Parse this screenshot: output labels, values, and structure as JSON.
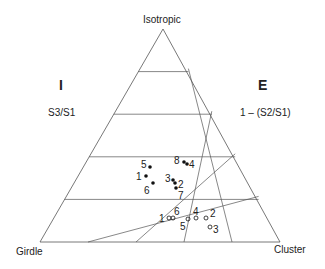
{
  "diagram": {
    "type": "ternary",
    "vertices": {
      "top": "Isotropic",
      "bottom_left": "Girdle",
      "bottom_right": "Cluster"
    },
    "left_index": {
      "symbol": "I",
      "formula": "S3/S1"
    },
    "right_index": {
      "symbol": "E",
      "formula": "1 – (S2/S1)"
    },
    "colors": {
      "line": "#555555",
      "text": "#222222",
      "point": "#111111"
    },
    "series": [
      {
        "name": "filled",
        "marker": "filled-circle",
        "points": [
          {
            "label": "5",
            "x": 150,
            "y": 167,
            "lx": 141,
            "ly": 160
          },
          {
            "label": "1",
            "x": 146,
            "y": 176,
            "lx": 136,
            "ly": 172
          },
          {
            "label": "6",
            "x": 153,
            "y": 183,
            "lx": 144,
            "ly": 186
          },
          {
            "label": "8",
            "x": 184,
            "y": 162,
            "lx": 174,
            "ly": 156
          },
          {
            "label": "4",
            "x": 187,
            "y": 164,
            "lx": 189,
            "ly": 160
          },
          {
            "label": "3",
            "x": 173,
            "y": 180,
            "lx": 165,
            "ly": 174
          },
          {
            "label": "2",
            "x": 175,
            "y": 183,
            "lx": 178,
            "ly": 180
          },
          {
            "label": "7",
            "x": 176,
            "y": 188,
            "lx": 178,
            "ly": 191
          }
        ]
      },
      {
        "name": "open",
        "marker": "open-circle",
        "points": [
          {
            "label": "1",
            "x": 169,
            "y": 218,
            "lx": 159,
            "ly": 214
          },
          {
            "label": "6",
            "x": 173,
            "y": 218,
            "lx": 174,
            "ly": 207
          },
          {
            "label": "5",
            "x": 188,
            "y": 219,
            "lx": 180,
            "ly": 222
          },
          {
            "label": "4",
            "x": 196,
            "y": 218,
            "lx": 193,
            "ly": 207
          },
          {
            "label": "2",
            "x": 206,
            "y": 218,
            "lx": 210,
            "ly": 209
          },
          {
            "label": "3",
            "x": 210,
            "y": 227,
            "lx": 213,
            "ly": 225
          }
        ]
      }
    ]
  }
}
